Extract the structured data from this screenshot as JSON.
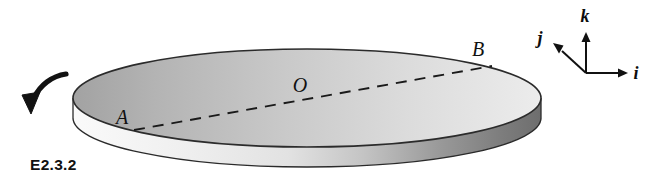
{
  "figure": {
    "id_label": "E2.3.2",
    "background_color": "#ffffff",
    "ink_color": "#111111"
  },
  "disk": {
    "name": "circular-disk",
    "top_face_gradient": [
      "#a9a9a9",
      "#e9e9e9"
    ],
    "side_wall_gradient": [
      "#f2f2f2",
      "#6f6f6f"
    ],
    "outline_color": "#2b2b2b"
  },
  "points": [
    {
      "key": "A",
      "label": "A",
      "x": 122,
      "y": 124
    },
    {
      "key": "O",
      "label": "O",
      "x": 300,
      "y": 92
    },
    {
      "key": "B",
      "label": "B",
      "x": 478,
      "y": 56
    }
  ],
  "diameter_line": {
    "name": "dashed-diameter-AB",
    "from": "A",
    "to": "B",
    "style": "dashed"
  },
  "rotation_arrow": {
    "name": "rotation-arrow",
    "direction": "counterclockwise",
    "position": "left-of-disk"
  },
  "axes": {
    "origin": {
      "x": 586,
      "y": 73
    },
    "vectors": [
      {
        "key": "i",
        "label": "i",
        "label_x": 634,
        "label_y": 78,
        "tip_x": 624,
        "tip_y": 73
      },
      {
        "key": "j",
        "label": "j",
        "label_x": 539,
        "label_y": 43,
        "tip_x": 556,
        "tip_y": 46
      },
      {
        "key": "k",
        "label": "k",
        "label_x": 583,
        "label_y": 20,
        "tip_x": 586,
        "tip_y": 35
      }
    ]
  }
}
